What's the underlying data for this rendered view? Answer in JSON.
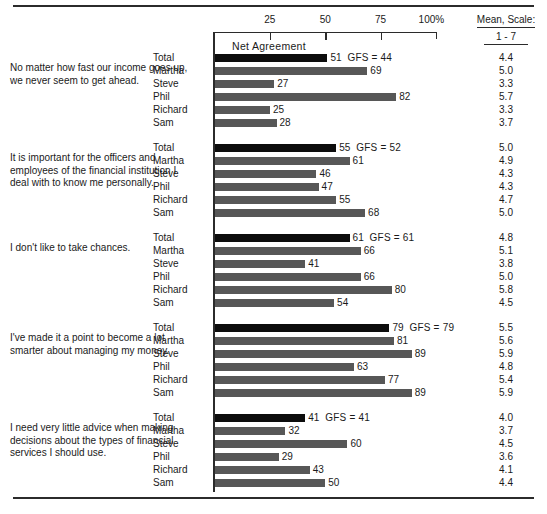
{
  "axis": {
    "ticks": [
      "25",
      "50",
      "75",
      "100%"
    ],
    "tick_values": [
      25,
      50,
      75,
      100
    ],
    "net_agreement_label": "Net Agreement",
    "range_min": 0,
    "range_max": 100
  },
  "mean_header": {
    "line1": "Mean, Scale:",
    "line2": "1 - 7"
  },
  "gfs_prefix": "GFS =",
  "chart_data": {
    "type": "bar",
    "title": "Net Agreement",
    "xlabel": "",
    "ylabel": "",
    "xlim": [
      0,
      100
    ],
    "grid": false,
    "legend": "none",
    "axis_ticks": [
      25,
      50,
      75,
      100
    ],
    "axis_tick_labels": [
      "25",
      "50",
      "75",
      "100%"
    ],
    "categories": [
      "Total",
      "Martha",
      "Steve",
      "Phil",
      "Richard",
      "Sam"
    ],
    "extra_columns": [
      "GFS",
      "Mean, Scale: 1 - 7"
    ],
    "groups": [
      {
        "statement": "No matter how fast our income goes up, we never seem to get ahead.",
        "gfs": 44,
        "rows": [
          {
            "label": "Total",
            "value": 51,
            "mean": "4.4",
            "is_total": true
          },
          {
            "label": "Martha",
            "value": 69,
            "mean": "5.0",
            "is_total": false
          },
          {
            "label": "Steve",
            "value": 27,
            "mean": "3.3",
            "is_total": false
          },
          {
            "label": "Phil",
            "value": 82,
            "mean": "5.7",
            "is_total": false
          },
          {
            "label": "Richard",
            "value": 25,
            "mean": "3.3",
            "is_total": false
          },
          {
            "label": "Sam",
            "value": 28,
            "mean": "3.7",
            "is_total": false
          }
        ]
      },
      {
        "statement": "It is important for the officers and employees of the financial institution I deal with to know me personally.",
        "gfs": 52,
        "rows": [
          {
            "label": "Total",
            "value": 55,
            "mean": "5.0",
            "is_total": true
          },
          {
            "label": "Martha",
            "value": 61,
            "mean": "4.9",
            "is_total": false
          },
          {
            "label": "Steve",
            "value": 46,
            "mean": "4.3",
            "is_total": false
          },
          {
            "label": "Phil",
            "value": 47,
            "mean": "4.3",
            "is_total": false
          },
          {
            "label": "Richard",
            "value": 55,
            "mean": "4.7",
            "is_total": false
          },
          {
            "label": "Sam",
            "value": 68,
            "mean": "5.0",
            "is_total": false
          }
        ]
      },
      {
        "statement": "I don't like to take chances.",
        "gfs": 61,
        "rows": [
          {
            "label": "Total",
            "value": 61,
            "mean": "4.8",
            "is_total": true
          },
          {
            "label": "Martha",
            "value": 66,
            "mean": "5.1",
            "is_total": false
          },
          {
            "label": "Steve",
            "value": 41,
            "mean": "3.8",
            "is_total": false
          },
          {
            "label": "Phil",
            "value": 66,
            "mean": "5.0",
            "is_total": false
          },
          {
            "label": "Richard",
            "value": 80,
            "mean": "5.8",
            "is_total": false
          },
          {
            "label": "Sam",
            "value": 54,
            "mean": "4.5",
            "is_total": false
          }
        ]
      },
      {
        "statement": "I've made it a point to become a lot smarter about managing my money.",
        "gfs": 79,
        "rows": [
          {
            "label": "Total",
            "value": 79,
            "mean": "5.5",
            "is_total": true
          },
          {
            "label": "Martha",
            "value": 81,
            "mean": "5.6",
            "is_total": false
          },
          {
            "label": "Steve",
            "value": 89,
            "mean": "5.9",
            "is_total": false
          },
          {
            "label": "Phil",
            "value": 63,
            "mean": "4.8",
            "is_total": false
          },
          {
            "label": "Richard",
            "value": 77,
            "mean": "5.4",
            "is_total": false
          },
          {
            "label": "Sam",
            "value": 89,
            "mean": "5.9",
            "is_total": false
          }
        ]
      },
      {
        "statement": "I need very little advice when making decisions about the types of financial services I should use.",
        "gfs": 41,
        "rows": [
          {
            "label": "Total",
            "value": 41,
            "mean": "4.0",
            "is_total": true
          },
          {
            "label": "Martha",
            "value": 32,
            "mean": "3.7",
            "is_total": false
          },
          {
            "label": "Steve",
            "value": 60,
            "mean": "4.5",
            "is_total": false
          },
          {
            "label": "Phil",
            "value": 29,
            "mean": "3.6",
            "is_total": false
          },
          {
            "label": "Richard",
            "value": 43,
            "mean": "4.1",
            "is_total": false
          },
          {
            "label": "Sam",
            "value": 50,
            "mean": "4.4",
            "is_total": false
          }
        ]
      }
    ]
  },
  "colors": {
    "total_bar": "#0d0d0d",
    "bar": "#575757",
    "rule": "#2b2b2b",
    "text": "#1a1a1a"
  }
}
